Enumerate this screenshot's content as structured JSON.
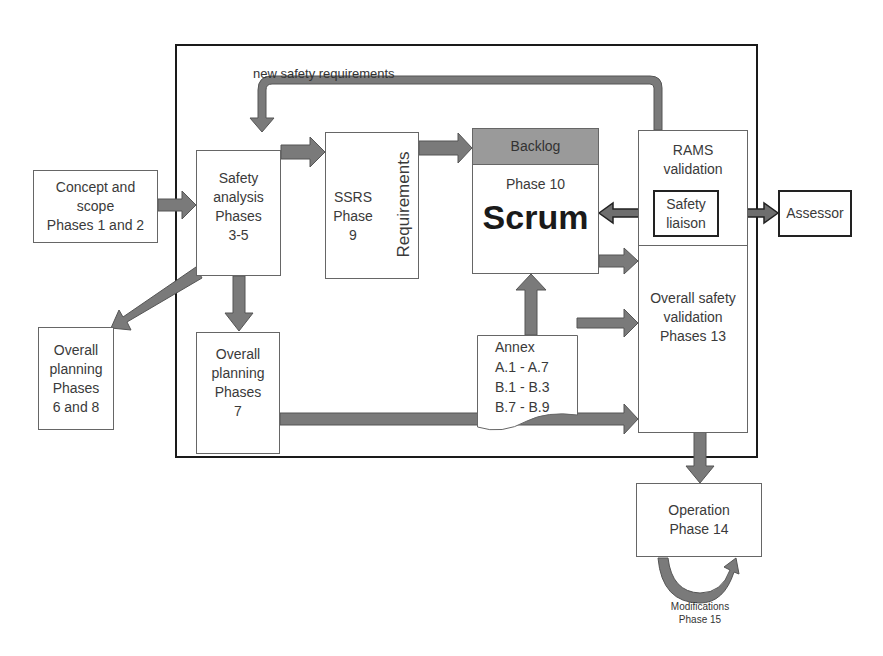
{
  "diagram": {
    "feedback_label": "new safety requirements",
    "nodes": {
      "concept": {
        "lines": [
          "Concept and",
          "scope",
          "Phases 1 and 2"
        ]
      },
      "safety_analysis": {
        "lines": [
          "Safety",
          "analysis",
          "Phases",
          "3-5"
        ]
      },
      "ssrs": {
        "lines": [
          "SSRS",
          "Phase",
          "9"
        ],
        "side_label": "Requirements"
      },
      "scrum": {
        "header": "Backlog",
        "phase": "Phase 10",
        "title": "Scrum"
      },
      "rams": {
        "lines": [
          "RAMS",
          "validation"
        ]
      },
      "safety_liaison": {
        "lines": [
          "Safety",
          "liaison"
        ]
      },
      "assessor": {
        "label": "Assessor"
      },
      "overall_validation": {
        "lines": [
          "Overall safety",
          "validation",
          "Phases 13"
        ]
      },
      "planning_6_8": {
        "lines": [
          "Overall",
          "planning",
          "Phases",
          "6 and 8"
        ]
      },
      "planning_7": {
        "lines": [
          "Overall",
          "planning",
          "Phases",
          "7"
        ]
      },
      "annex": {
        "lines": [
          "Annex",
          "A.1 - A.7",
          "B.1 - B.3",
          "B.7 - B.9"
        ]
      },
      "operation": {
        "lines": [
          "Operation",
          "Phase 14"
        ]
      },
      "modifications": {
        "lines": [
          "Modifications",
          "Phase 15"
        ]
      }
    },
    "colors": {
      "arrow_fill": "#7a7a7a",
      "arrow_stroke": "#555555",
      "backlog_fill": "#9a9a9a",
      "frame": "#1a1a1a",
      "box_border": "#666666"
    }
  }
}
